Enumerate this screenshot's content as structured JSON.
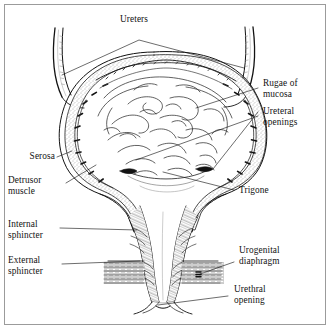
{
  "figure": {
    "background_color": "#ffffff",
    "ink_color": "#121212",
    "frame_color": "#9b9b9b",
    "width": 332,
    "height": 331
  },
  "labels": {
    "ureters": "Ureters",
    "rugae_of_mucosa": "Rugae of\nmucosa",
    "ureteral_openings": "Ureteral\nopenings",
    "serosa": "Serosa",
    "detrusor_muscle": "Detrusor\nmuscle",
    "trigone": "Trigone",
    "internal_sphincter": "Internal\nsphincter",
    "external_sphincter": "External\nsphincter",
    "urogenital_diaphragm": "Urogenital\ndiaphragm",
    "urethral_opening": "Urethral\nopening"
  },
  "structures": [
    {
      "name": "left-ureter",
      "side": "left"
    },
    {
      "name": "right-ureter",
      "side": "right"
    },
    {
      "name": "bladder-dome",
      "side": "center"
    },
    {
      "name": "bladder-wall-serosa",
      "side": "outer"
    },
    {
      "name": "detrusor-muscle-layer",
      "side": "wall"
    },
    {
      "name": "mucosal-rugae",
      "side": "interior"
    },
    {
      "name": "trigone-region",
      "side": "interior-base"
    },
    {
      "name": "left-ureteral-opening",
      "side": "left"
    },
    {
      "name": "right-ureteral-opening",
      "side": "right"
    },
    {
      "name": "bladder-neck",
      "side": "center"
    },
    {
      "name": "internal-sphincter-region",
      "side": "center"
    },
    {
      "name": "external-sphincter-region",
      "side": "center"
    },
    {
      "name": "urethra",
      "side": "center"
    },
    {
      "name": "urogenital-diaphragm-left",
      "side": "left"
    },
    {
      "name": "urogenital-diaphragm-right",
      "side": "right"
    },
    {
      "name": "urethral-opening-region",
      "side": "bottom"
    }
  ]
}
